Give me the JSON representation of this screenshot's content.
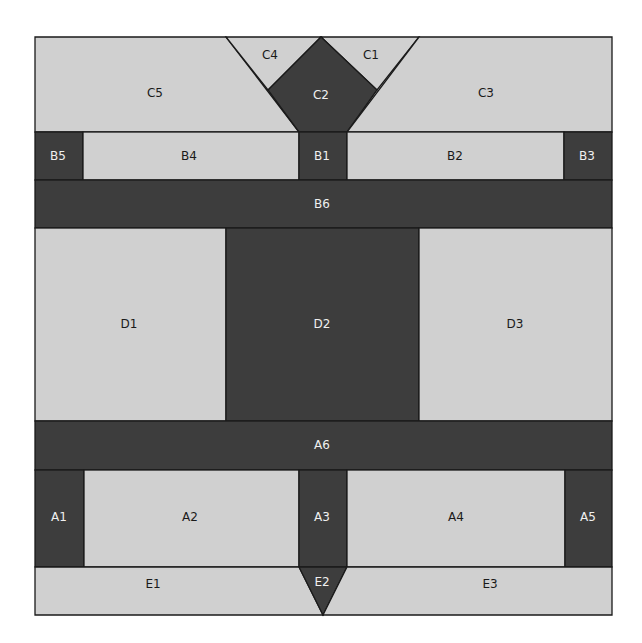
{
  "diagram": {
    "colors": {
      "light": "#d0d0d0",
      "dark": "#3d3d3d",
      "border": "#1a1a1a"
    },
    "pieces": {
      "C1": {
        "label": "C1",
        "tone": "light"
      },
      "C2": {
        "label": "C2",
        "tone": "dark"
      },
      "C3": {
        "label": "C3",
        "tone": "light"
      },
      "C4": {
        "label": "C4",
        "tone": "light"
      },
      "C5": {
        "label": "C5",
        "tone": "light"
      },
      "B1": {
        "label": "B1",
        "tone": "dark"
      },
      "B2": {
        "label": "B2",
        "tone": "light"
      },
      "B3": {
        "label": "B3",
        "tone": "dark"
      },
      "B4": {
        "label": "B4",
        "tone": "light"
      },
      "B5": {
        "label": "B5",
        "tone": "dark"
      },
      "B6": {
        "label": "B6",
        "tone": "dark"
      },
      "D1": {
        "label": "D1",
        "tone": "light"
      },
      "D2": {
        "label": "D2",
        "tone": "dark"
      },
      "D3": {
        "label": "D3",
        "tone": "light"
      },
      "A1": {
        "label": "A1",
        "tone": "dark"
      },
      "A2": {
        "label": "A2",
        "tone": "light"
      },
      "A3": {
        "label": "A3",
        "tone": "dark"
      },
      "A4": {
        "label": "A4",
        "tone": "light"
      },
      "A5": {
        "label": "A5",
        "tone": "dark"
      },
      "A6": {
        "label": "A6",
        "tone": "dark"
      },
      "E1": {
        "label": "E1",
        "tone": "light"
      },
      "E2": {
        "label": "E2",
        "tone": "dark"
      },
      "E3": {
        "label": "E3",
        "tone": "light"
      }
    }
  }
}
